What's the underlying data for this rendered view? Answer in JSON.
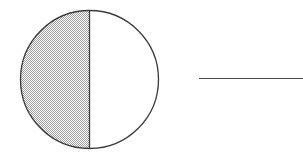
{
  "figure": {
    "title": "Half-shaded circle with adjacent horizontal line segment",
    "canvas": {
      "width": 303,
      "height": 160,
      "background_color": "#ffffff"
    },
    "stroke_color": "#3a3a3a",
    "shade_color": "#cfcfcf",
    "shade_pattern": "fine-checkerboard-dither",
    "unshaded_color": "#ffffff",
    "shapes": [
      {
        "name": "circle-outline",
        "type": "circle",
        "center_x": 89.5,
        "center_y": 79.5,
        "radius": 69,
        "stroke_width": 1.3,
        "fill": "none"
      },
      {
        "name": "left-half-shaded",
        "type": "semicircle",
        "side": "left",
        "fraction_of_circle": 0.5,
        "fill": "#cfcfcf"
      },
      {
        "name": "right-half-unshaded",
        "type": "semicircle",
        "side": "right",
        "fraction_of_circle": 0.5,
        "fill": "#ffffff"
      },
      {
        "name": "vertical-diameter",
        "type": "line",
        "x1": 89.5,
        "y1": 10.5,
        "x2": 89.5,
        "y2": 148.5,
        "stroke_width": 1.3
      },
      {
        "name": "horizontal-line-segment",
        "type": "line",
        "x1": 199,
        "y1": 78.5,
        "x2": 303,
        "y2": 78.5,
        "stroke_width": 1.2
      }
    ]
  }
}
